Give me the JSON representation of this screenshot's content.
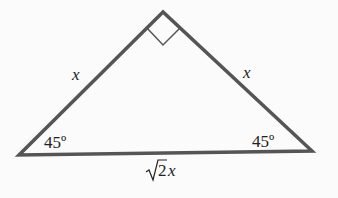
{
  "diagram": {
    "vertices": {
      "top": [
        163,
        12
      ],
      "bottom_left": [
        19,
        155
      ],
      "bottom_right": [
        312,
        151
      ]
    },
    "right_angle_marker": {
      "points": [
        [
          147,
          28
        ],
        [
          163,
          45
        ],
        [
          180,
          28
        ]
      ]
    },
    "labels": {
      "left_leg": "x",
      "right_leg": "x",
      "left_angle": "45º",
      "right_angle": "45º",
      "hypotenuse_coef": "2",
      "hypotenuse_var": "x"
    },
    "colors": {
      "stroke": "#555555",
      "text": "#222222",
      "background": "#fbfbfb"
    }
  }
}
